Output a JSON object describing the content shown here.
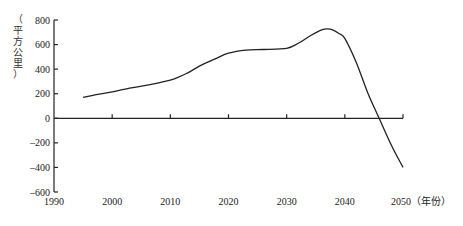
{
  "chart_data": {
    "type": "line",
    "title": "",
    "xlabel": "（年份）",
    "ylabel": "（平方公里）",
    "xlim": [
      1990,
      2050
    ],
    "ylim": [
      -600,
      800
    ],
    "x_ticks": [
      1990,
      2000,
      2010,
      2020,
      2030,
      2040,
      2050
    ],
    "y_ticks": [
      800,
      600,
      400,
      200,
      0,
      -200,
      -400,
      -600
    ],
    "grid": false,
    "legend": null,
    "series": [
      {
        "name": "area",
        "x": [
          1995,
          1997,
          2000,
          2003,
          2006,
          2010,
          2013,
          2015,
          2018,
          2020,
          2023,
          2026,
          2030,
          2032,
          2034,
          2036,
          2037.5,
          2039,
          2040,
          2042,
          2044,
          2046,
          2048,
          2050
        ],
        "values": [
          170,
          190,
          215,
          245,
          270,
          310,
          370,
          425,
          490,
          530,
          555,
          560,
          570,
          610,
          670,
          720,
          725,
          690,
          650,
          450,
          200,
          -10,
          -220,
          -400
        ]
      }
    ]
  },
  "axis": {
    "x_label_suffix": "（年份）",
    "y_label_chars": [
      "（",
      "平",
      "方",
      "公",
      "里",
      "）"
    ]
  }
}
